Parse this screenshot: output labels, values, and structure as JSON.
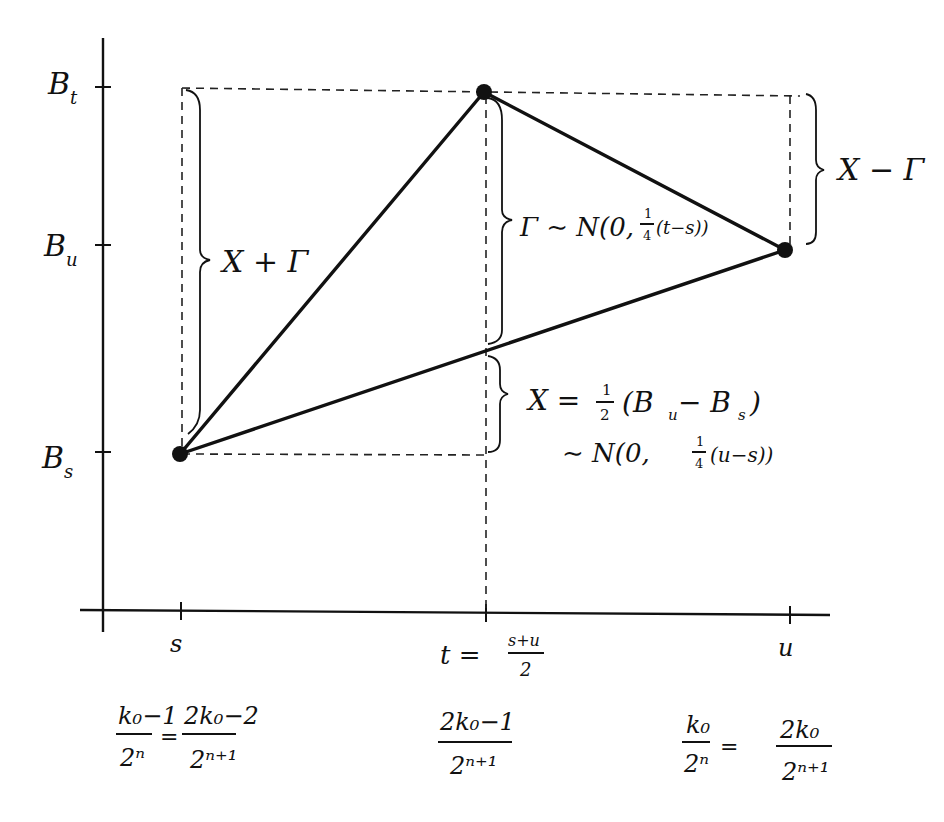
{
  "diagram": {
    "type": "brownian-bridge-midpoint-construction",
    "y_axis": {
      "labels": {
        "B_t": "B",
        "B_t_sub": "t",
        "B_u": "B",
        "B_u_sub": "u",
        "B_s": "B",
        "B_s_sub": "s"
      }
    },
    "x_axis": {
      "s_label": "s",
      "t_label": "t =",
      "t_num": "s+u",
      "t_den": "2",
      "u_label": "u"
    },
    "braces": {
      "left": "X + Γ",
      "middle_gamma": "Γ ∼ N(0, ",
      "middle_frac_num": "1",
      "middle_frac_den": "4",
      "middle_tail": "(t−s))",
      "right": "X − Γ",
      "lower_line1_lhs": "X =",
      "lower_line1_frac_num": "1",
      "lower_line1_frac_den": "2",
      "lower_line1_rhs": "(B",
      "lower_line1_sub_u": "u",
      "lower_line1_minus": " − B",
      "lower_line1_sub_s": "s",
      "lower_line1_close": ")",
      "lower_line2_pre": "∼ N(0, ",
      "lower_line2_frac_num": "1",
      "lower_line2_frac_den": "4",
      "lower_line2_tail": "(u−s))"
    },
    "dyadic": {
      "left_num1": "k₀−1",
      "left_den1": "2ⁿ",
      "left_eq": "=",
      "left_num2": "2k₀−2",
      "left_den2": "2ⁿ⁺¹",
      "mid_num": "2k₀−1",
      "mid_den": "2ⁿ⁺¹",
      "right_num1": "k₀",
      "right_den1": "2ⁿ",
      "right_eq": "=",
      "right_num2": "2k₀",
      "right_den2": "2ⁿ⁺¹"
    },
    "points": [
      {
        "name": "point-s",
        "x": 180,
        "y": 454
      },
      {
        "name": "point-t",
        "x": 484,
        "y": 92
      },
      {
        "name": "point-u",
        "x": 785,
        "y": 250
      }
    ]
  }
}
